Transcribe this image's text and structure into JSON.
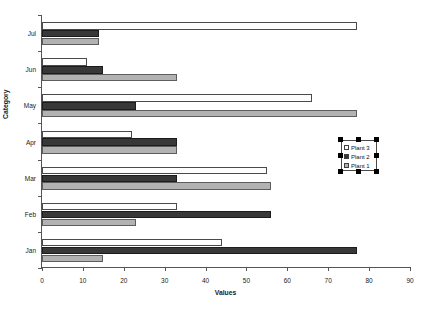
{
  "chart_data": {
    "type": "bar",
    "orientation": "horizontal",
    "title": "",
    "xlabel": "Values",
    "ylabel": "Category",
    "xlim": [
      0,
      90
    ],
    "xticks": [
      0,
      10,
      20,
      30,
      40,
      50,
      60,
      70,
      80,
      90
    ],
    "grid": false,
    "legend_position": "right-middle",
    "legend_selected": true,
    "categories": [
      "Jan",
      "Feb",
      "Mar",
      "Apr",
      "May",
      "Jun",
      "Jul"
    ],
    "category_order_top_to_bottom": [
      "Jul",
      "Jun",
      "May",
      "Apr",
      "Mar",
      "Feb",
      "Jan"
    ],
    "series": [
      {
        "name": "Plant 1",
        "color": "#b2b2b2",
        "values": [
          15,
          23,
          56,
          33,
          77,
          33,
          14
        ]
      },
      {
        "name": "Plant 2",
        "color": "#383838",
        "values": [
          77,
          56,
          33,
          33,
          23,
          15,
          14
        ]
      },
      {
        "name": "Plant 3",
        "color": "#fdfdfd",
        "values": [
          44,
          33,
          55,
          22,
          66,
          11,
          77
        ]
      }
    ]
  },
  "axes": {
    "x_title": "Values",
    "y_title": "Category",
    "x_tick_labels": [
      "0",
      "10",
      "20",
      "30",
      "40",
      "50",
      "60",
      "70",
      "80",
      "90"
    ],
    "y_tick_labels": [
      "Jul",
      "Jun",
      "May",
      "Apr",
      "Mar",
      "Feb",
      "Jan"
    ]
  },
  "legend": {
    "entries": [
      {
        "label": "Plant 3",
        "swatch": "#fdfdfd"
      },
      {
        "label": "Plant 2",
        "swatch": "#383838"
      },
      {
        "label": "Plant 1",
        "swatch": "#b2b2b2"
      }
    ]
  },
  "colors": {
    "series_1": "#b2b2b2",
    "series_2": "#383838",
    "series_3": "#fdfdfd",
    "axis": "#555555",
    "text": "#1a1a1a",
    "background": "#ffffff"
  }
}
